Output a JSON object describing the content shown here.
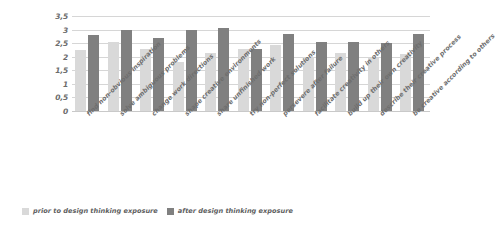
{
  "chart_data": {
    "type": "bar",
    "title": "",
    "xlabel": "",
    "ylabel": "",
    "ylim": [
      0,
      3.5
    ],
    "yticks": [
      "0",
      "0,5",
      "1",
      "1,5",
      "2",
      "2,5",
      "3",
      "3,5"
    ],
    "ytick_values": [
      0,
      0.5,
      1,
      1.5,
      2,
      2.5,
      3,
      3.5
    ],
    "grid": true,
    "legend_position": "bottom-left",
    "categories": [
      "find non-obvious inspiration",
      "solve ambiguous problems",
      "change work directions",
      "shape creative environments",
      "share unfinished work",
      "try non-perfect solutions",
      "persevere after failure",
      "facilitate creativity in others",
      "build up their own creativity",
      "describe their creative process",
      "be creative according to others"
    ],
    "series": [
      {
        "name": "prior to design thinking exposure",
        "color": "#d9d9d9",
        "values": [
          2.25,
          2.55,
          2.3,
          1.8,
          2.15,
          2.3,
          2.45,
          2.0,
          2.15,
          1.95,
          2.1
        ]
      },
      {
        "name": "after design thinking exposure",
        "color": "#808080",
        "values": [
          2.8,
          3.0,
          2.7,
          3.0,
          3.05,
          2.3,
          2.85,
          2.55,
          2.55,
          2.5,
          2.85
        ]
      }
    ]
  },
  "legend": {
    "entries": [
      {
        "label": "prior to design thinking exposure"
      },
      {
        "label": "after design thinking exposure"
      }
    ]
  },
  "colors": {
    "prior": "#d9d9d9",
    "after": "#808080",
    "gridline": "#d6d6d6",
    "text": "#5f5f5f"
  }
}
